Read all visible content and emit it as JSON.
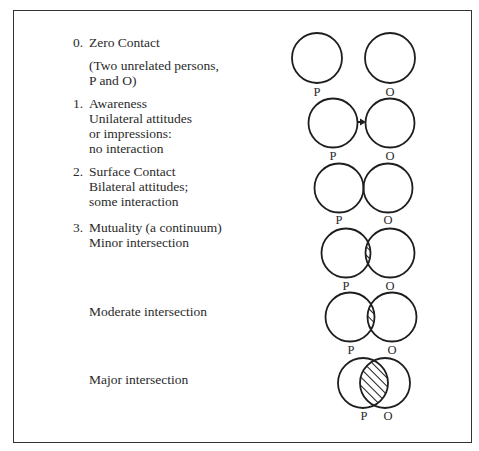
{
  "stages": [
    {
      "number": "0.",
      "title": "Zero Contact",
      "note_lines": [
        "(Two unrelated persons,",
        "P and O)"
      ]
    },
    {
      "number": "1.",
      "title": "Awareness",
      "lines": [
        "Unilateral attitudes",
        "or impressions:",
        "no interaction"
      ]
    },
    {
      "number": "2.",
      "title": "Surface Contact",
      "lines": [
        "Bilateral attitudes;",
        "some interaction"
      ]
    },
    {
      "number": "3.",
      "title": "Mutuality (a continuum)",
      "lines": [
        "Minor intersection"
      ]
    },
    {
      "title": "Moderate intersection"
    },
    {
      "title": "Major intersection"
    }
  ],
  "labels": {
    "p": "P",
    "o": "O"
  },
  "colors": {
    "stroke": "#1e1e1e",
    "text": "#2a2a2a",
    "frame": "#333333"
  }
}
